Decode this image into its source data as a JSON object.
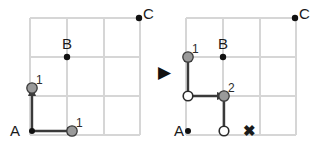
{
  "figure": {
    "type": "grid-path-diagram",
    "width": 323,
    "height": 161,
    "background": "#ffffff",
    "transition_arrow": "▶",
    "colors": {
      "grid_line": "#d4d4d4",
      "path_stroke": "#3a3a3a",
      "token_fill": "#9a9a9a",
      "token_stroke": "#3a3a3a",
      "open_node_fill": "#ffffff",
      "open_node_stroke": "#2b2b2b",
      "point_fill": "#111111",
      "text": "#1a1a1a"
    }
  },
  "left_panel": {
    "name": "before-state",
    "grid": {
      "cols": 3,
      "rows": 3,
      "x0": 30,
      "y0": 18,
      "step_x": 36.7,
      "step_y": 39
    },
    "points": [
      {
        "id": "A",
        "label": "A",
        "col": 0,
        "row": 3,
        "label_side": "left"
      },
      {
        "id": "B",
        "label": "B",
        "col": 1,
        "row": 1,
        "label_side": "above"
      },
      {
        "id": "C",
        "label": "C",
        "col": 3,
        "row": 0,
        "label_side": "right"
      }
    ],
    "tokens": [
      {
        "label": "1",
        "col": 0,
        "row": 2,
        "fill": "gray"
      },
      {
        "label": "1",
        "col": 1,
        "row": 3,
        "fill": "gray"
      }
    ],
    "arrows": [
      {
        "from_col": 0,
        "from_row": 3,
        "to_col": 0,
        "to_row": 2,
        "direction": "up"
      },
      {
        "from_col": 0,
        "from_row": 3,
        "to_col": 1,
        "to_row": 3,
        "direction": "right"
      }
    ]
  },
  "right_panel": {
    "name": "after-state",
    "grid": {
      "cols": 3,
      "rows": 3,
      "x0": 186,
      "y0": 18,
      "step_x": 36.7,
      "step_y": 39
    },
    "points": [
      {
        "id": "A",
        "label": "A",
        "col": 0,
        "row": 3,
        "label_side": "left"
      },
      {
        "id": "B",
        "label": "B",
        "col": 1,
        "row": 1,
        "label_side": "above"
      },
      {
        "id": "C",
        "label": "C",
        "col": 3,
        "row": 0,
        "label_side": "right"
      }
    ],
    "tokens": [
      {
        "label": "1",
        "col": 0,
        "row": 1,
        "fill": "gray"
      },
      {
        "label": "2",
        "col": 1,
        "row": 2,
        "fill": "gray"
      }
    ],
    "open_nodes": [
      {
        "col": 0,
        "row": 2
      },
      {
        "col": 1,
        "row": 3
      }
    ],
    "arrows": [
      {
        "from_col": 0,
        "from_row": 2,
        "to_col": 0,
        "to_row": 1,
        "direction": "up"
      },
      {
        "from_col": 0,
        "from_row": 2,
        "to_col": 1,
        "to_row": 2,
        "direction": "right"
      },
      {
        "from_col": 1,
        "from_row": 3,
        "to_col": 1,
        "to_row": 2,
        "direction": "up"
      }
    ],
    "marks": [
      {
        "symbol": "✖",
        "col": 2,
        "row": 3,
        "name": "cross-mark"
      }
    ]
  },
  "labels": {
    "A": "A",
    "B": "B",
    "C": "C",
    "one": "1",
    "two": "2",
    "cross": "✖",
    "transition": "▶"
  }
}
